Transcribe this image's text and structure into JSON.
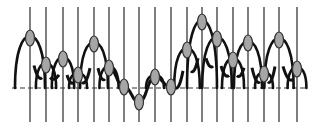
{
  "diagram": {
    "baseline_y": 88,
    "line_top_y": 7,
    "line_bottom_y": 122,
    "baseline_x_start": 12,
    "baseline_x_end": 306,
    "colors": {
      "line": "#3a3a3a",
      "node_fill": "#a6a6a6",
      "node_stroke": "#333333",
      "envelope": "#111111",
      "background": "#ffffff"
    },
    "nodes": [
      {
        "x": 30,
        "y": 38
      },
      {
        "x": 46,
        "y": 65
      },
      {
        "x": 63,
        "y": 59
      },
      {
        "x": 78,
        "y": 75
      },
      {
        "x": 94,
        "y": 44
      },
      {
        "x": 109,
        "y": 68
      },
      {
        "x": 124,
        "y": 87
      },
      {
        "x": 139,
        "y": 102
      },
      {
        "x": 155,
        "y": 77
      },
      {
        "x": 171,
        "y": 87
      },
      {
        "x": 187,
        "y": 50
      },
      {
        "x": 202,
        "y": 22
      },
      {
        "x": 217,
        "y": 39
      },
      {
        "x": 233,
        "y": 60
      },
      {
        "x": 248,
        "y": 43
      },
      {
        "x": 264,
        "y": 74
      },
      {
        "x": 279,
        "y": 40
      },
      {
        "x": 297,
        "y": 69
      }
    ]
  }
}
